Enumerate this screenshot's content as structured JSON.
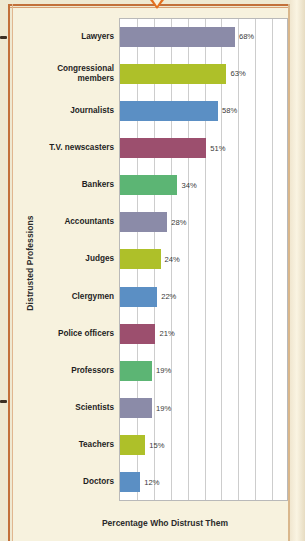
{
  "chart_data": {
    "type": "bar",
    "orientation": "horizontal",
    "title": "",
    "xlabel": "Percentage Who Distrust Them",
    "ylabel": "Distrusted Professions",
    "xlim": [
      0,
      100
    ],
    "grid": true,
    "gridline_interval": 10,
    "legend": "none",
    "value_suffix": "%",
    "categories": [
      "Lawyers",
      "Congressional members",
      "Journalists",
      "T.V. newscasters",
      "Bankers",
      "Accountants",
      "Judges",
      "Clergymen",
      "Police officers",
      "Professors",
      "Scientists",
      "Teachers",
      "Doctors"
    ],
    "values": [
      68,
      63,
      58,
      51,
      34,
      28,
      24,
      22,
      21,
      19,
      19,
      15,
      12
    ],
    "value_labels": [
      "68%",
      "63%",
      "58%",
      "51%",
      "34%",
      "28%",
      "24%",
      "22%",
      "21%",
      "19%",
      "19%",
      "15%",
      "12%"
    ],
    "bar_colors": [
      "#8b8ba8",
      "#aec029",
      "#5b8fc4",
      "#9c4f6e",
      "#5cb574",
      "#8b8ba8",
      "#aec029",
      "#5b8fc4",
      "#9c4f6e",
      "#5cb574",
      "#8b8ba8",
      "#aec029",
      "#5b8fc4"
    ]
  },
  "palette": {
    "page_background": "#efe9d2",
    "card_background": "#f7f2de",
    "plot_background": "#ffffff",
    "frame_accent": "#c2703a",
    "notch_accent": "#e4701f",
    "gridline": "#cdcdcd",
    "text": "#1f1f1f"
  },
  "labels": {
    "category_lines": [
      [
        "Lawyers"
      ],
      [
        "Congressional",
        "members"
      ],
      [
        "Journalists"
      ],
      [
        "T.V. newscasters"
      ],
      [
        "Bankers"
      ],
      [
        "Accountants"
      ],
      [
        "Judges"
      ],
      [
        "Clergymen"
      ],
      [
        "Police officers"
      ],
      [
        "Professors"
      ],
      [
        "Scientists"
      ],
      [
        "Teachers"
      ],
      [
        "Doctors"
      ]
    ]
  }
}
